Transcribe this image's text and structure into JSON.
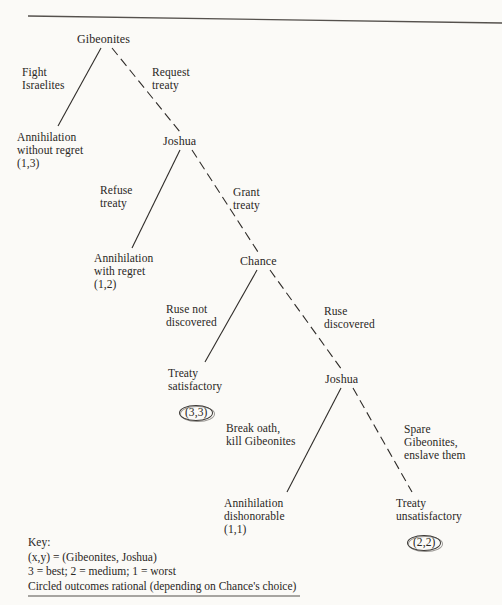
{
  "figure": {
    "ink_color": "#2a2724",
    "background_color": "#fbfaf7"
  },
  "nodes": {
    "root": "Gibeonites",
    "joshua_1": "Joshua",
    "chance": "Chance",
    "joshua_2": "Joshua"
  },
  "edges": {
    "fight_israelites": "Fight\nIsraelites",
    "request_treaty": "Request\ntreaty",
    "refuse_treaty": "Refuse\ntreaty",
    "grant_treaty": "Grant\ntreaty",
    "ruse_not_discovered": "Ruse not\ndiscovered",
    "ruse_discovered": "Ruse\ndiscovered",
    "break_oath": "Break oath,\nkill Gibeonites",
    "spare_gibeonites": "Spare\nGibeonites,\nenslave them"
  },
  "outcomes": {
    "annihilation_without_regret": {
      "label": "Annihilation\nwithout regret",
      "payoff": "(1,3)",
      "circled": false
    },
    "annihilation_with_regret": {
      "label": "Annihilation\nwith regret",
      "payoff": "(1,2)",
      "circled": false
    },
    "treaty_satisfactory": {
      "label": "Treaty\nsatisfactory",
      "payoff": "(3,3)",
      "circled": true
    },
    "annihilation_dishonorable": {
      "label": "Annihilation\ndishonorable",
      "payoff": "(1,1)",
      "circled": false
    },
    "treaty_unsatisfactory": {
      "label": "Treaty\nunsatisfactory",
      "payoff": "(2,2)",
      "circled": true
    }
  },
  "key": {
    "heading": "Key:",
    "line_players": "(x,y) = (Gibeonites, Joshua)",
    "line_ranking": "3 = best; 2 = medium; 1 = worst",
    "line_circled": "Circled outcomes rational (depending on Chance's choice)"
  }
}
